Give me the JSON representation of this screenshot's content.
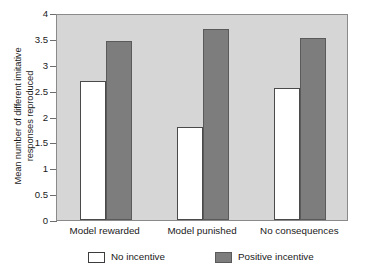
{
  "chart_data": {
    "type": "bar",
    "title": "",
    "xlabel": "",
    "ylabel": "Mean number of different imitative\nresponses reproduced",
    "ylim": [
      0,
      4
    ],
    "ytick_labels": [
      "4",
      "3.5",
      "3",
      "2.5",
      "2",
      "1.5",
      "1",
      "0.5",
      "0"
    ],
    "ytick_values": [
      4,
      3.5,
      3,
      2.5,
      2,
      1.5,
      1,
      0.5,
      0
    ],
    "grid": false,
    "legend_position": "bottom",
    "categories": [
      "Model rewarded",
      "Model punished",
      "No consequences"
    ],
    "series": [
      {
        "name": "No incentive",
        "color": "#ffffff",
        "values": [
          2.69,
          1.79,
          2.56
        ]
      },
      {
        "name": "Positive incentive",
        "color": "#7d7d7d",
        "values": [
          3.45,
          3.69,
          3.51
        ]
      }
    ]
  },
  "plot_area": {
    "background_color": "#d6d6d6",
    "border_color": "#8a8a8a"
  }
}
